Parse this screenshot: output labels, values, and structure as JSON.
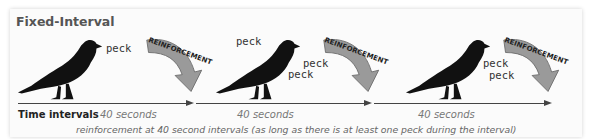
{
  "title": "Fixed-Interval",
  "colors": {
    "bird": "#111111",
    "reinforcement_arrow": "#9a9a9a",
    "axis": "#444444",
    "interval_text": "#777777"
  },
  "segments": [
    {
      "pecks": [
        "peck"
      ],
      "reinforcement_label": "REINFORCEMENT",
      "interval_label": "40 seconds"
    },
    {
      "pecks": [
        "peck",
        "peck",
        "peck"
      ],
      "reinforcement_label": "REINFORCEMENT",
      "interval_label": "40 seconds"
    },
    {
      "pecks": [
        "peck",
        "peck"
      ],
      "reinforcement_label": "REINFORCEMENT",
      "interval_label": "40 seconds"
    }
  ],
  "axis": {
    "label": "Time intervals"
  },
  "caption": "reinforcement at 40 second intervals (as long as there is at least one peck during the interval)"
}
